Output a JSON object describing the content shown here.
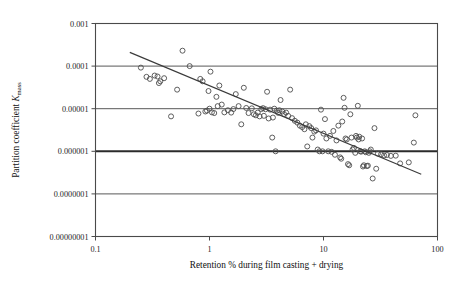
{
  "chart_data": {
    "type": "scatter",
    "title": "",
    "xlabel": "Retention % during film casting + drying",
    "ylabel_prefix": "Partition coefficient ",
    "ylabel_symbol": "K",
    "ylabel_subscript": "mass",
    "ylabel": "Partition coefficient Kmass",
    "xscale": "log",
    "yscale": "log",
    "xlim": [
      0.1,
      100
    ],
    "ylim": [
      1e-08,
      0.001
    ],
    "xticks": [
      0.1,
      1,
      10,
      100
    ],
    "xtick_labels": [
      "0.1",
      "1",
      "10",
      "100"
    ],
    "yticks": [
      0.001,
      0.0001,
      1e-05,
      1e-06,
      1e-07,
      1e-08
    ],
    "ytick_labels": [
      "0.001",
      "0.0001",
      "0.00001",
      "0.000001",
      "0.0000001",
      "0.00000001"
    ],
    "grid": "horizontal",
    "gridline_emphasis": 1e-06,
    "legend": "none",
    "marker": "open-circle",
    "marker_color": "#4d4d4d",
    "trendline": {
      "type": "power-law",
      "x_start": 0.2,
      "y_start": 0.00021,
      "x_end": 72,
      "y_end": 2.9e-07
    },
    "points": [
      {
        "x": 0.25,
        "y": 9.2e-05
      },
      {
        "x": 0.28,
        "y": 5.6e-05
      },
      {
        "x": 0.3,
        "y": 5e-05
      },
      {
        "x": 0.33,
        "y": 6e-05
      },
      {
        "x": 0.35,
        "y": 5.7e-05
      },
      {
        "x": 0.36,
        "y": 4e-05
      },
      {
        "x": 0.37,
        "y": 4.4e-05
      },
      {
        "x": 0.4,
        "y": 5.2e-05
      },
      {
        "x": 0.46,
        "y": 6.6e-06
      },
      {
        "x": 0.52,
        "y": 2.8e-05
      },
      {
        "x": 0.58,
        "y": 0.00023
      },
      {
        "x": 0.67,
        "y": 0.0001
      },
      {
        "x": 0.8,
        "y": 7.7e-06
      },
      {
        "x": 0.83,
        "y": 5e-05
      },
      {
        "x": 0.87,
        "y": 4.4e-05
      },
      {
        "x": 0.92,
        "y": 8.6e-06
      },
      {
        "x": 0.95,
        "y": 9e-06
      },
      {
        "x": 0.98,
        "y": 2.6e-05
      },
      {
        "x": 1.0,
        "y": 1e-05
      },
      {
        "x": 1.02,
        "y": 7.4e-05
      },
      {
        "x": 1.05,
        "y": 8.2e-06
      },
      {
        "x": 1.1,
        "y": 7.9e-06
      },
      {
        "x": 1.15,
        "y": 1.9e-05
      },
      {
        "x": 1.18,
        "y": 1.15e-05
      },
      {
        "x": 1.22,
        "y": 3.5e-05
      },
      {
        "x": 1.28,
        "y": 1.25e-05
      },
      {
        "x": 1.35,
        "y": 8.2e-06
      },
      {
        "x": 1.45,
        "y": 9.2e-06
      },
      {
        "x": 1.55,
        "y": 8.1e-06
      },
      {
        "x": 1.62,
        "y": 9.8e-06
      },
      {
        "x": 1.7,
        "y": 2.2e-05
      },
      {
        "x": 1.8,
        "y": 1.15e-05
      },
      {
        "x": 1.9,
        "y": 4.3e-06
      },
      {
        "x": 2.0,
        "y": 3.1e-05
      },
      {
        "x": 2.1,
        "y": 1.04e-05
      },
      {
        "x": 2.2,
        "y": 7.9e-06
      },
      {
        "x": 2.35,
        "y": 1.02e-05
      },
      {
        "x": 2.45,
        "y": 7.4e-06
      },
      {
        "x": 2.55,
        "y": 7e-06
      },
      {
        "x": 2.65,
        "y": 8.1e-06
      },
      {
        "x": 2.75,
        "y": 6.6e-06
      },
      {
        "x": 2.85,
        "y": 9.8e-06
      },
      {
        "x": 2.95,
        "y": 1.03e-05
      },
      {
        "x": 3.0,
        "y": 6.8e-06
      },
      {
        "x": 3.1,
        "y": 9.7e-06
      },
      {
        "x": 3.2,
        "y": 2.5e-05
      },
      {
        "x": 3.3,
        "y": 5.9e-06
      },
      {
        "x": 3.4,
        "y": 9.5e-06
      },
      {
        "x": 3.55,
        "y": 2.1e-06
      },
      {
        "x": 3.6,
        "y": 6.2e-06
      },
      {
        "x": 3.7,
        "y": 1e-05
      },
      {
        "x": 3.8,
        "y": 1e-06
      },
      {
        "x": 3.9,
        "y": 9e-06
      },
      {
        "x": 4.0,
        "y": 8e-06
      },
      {
        "x": 4.1,
        "y": 9.2e-06
      },
      {
        "x": 4.2,
        "y": 1.6e-05
      },
      {
        "x": 4.35,
        "y": 8.6e-06
      },
      {
        "x": 4.5,
        "y": 7.5e-06
      },
      {
        "x": 4.7,
        "y": 8.1e-06
      },
      {
        "x": 4.9,
        "y": 6.8e-06
      },
      {
        "x": 5.1,
        "y": 2.8e-05
      },
      {
        "x": 5.3,
        "y": 6e-06
      },
      {
        "x": 5.6,
        "y": 5.2e-06
      },
      {
        "x": 5.9,
        "y": 4.7e-06
      },
      {
        "x": 6.2,
        "y": 4e-06
      },
      {
        "x": 6.5,
        "y": 3.7e-06
      },
      {
        "x": 6.8,
        "y": 3.3e-06
      },
      {
        "x": 7.0,
        "y": 4.3e-06
      },
      {
        "x": 7.2,
        "y": 1.3e-06
      },
      {
        "x": 7.5,
        "y": 3.9e-06
      },
      {
        "x": 7.8,
        "y": 3.5e-06
      },
      {
        "x": 8.0,
        "y": 2.1e-06
      },
      {
        "x": 8.3,
        "y": 2.9e-06
      },
      {
        "x": 8.6,
        "y": 3.1e-06
      },
      {
        "x": 8.9,
        "y": 1.1e-06
      },
      {
        "x": 9.2,
        "y": 1e-06
      },
      {
        "x": 9.5,
        "y": 9.5e-06
      },
      {
        "x": 9.8,
        "y": 1e-06
      },
      {
        "x": 10.0,
        "y": 2.6e-06
      },
      {
        "x": 10.3,
        "y": 5.7e-06
      },
      {
        "x": 10.6,
        "y": 2e-06
      },
      {
        "x": 11.0,
        "y": 1e-06
      },
      {
        "x": 11.4,
        "y": 2.3e-06
      },
      {
        "x": 11.8,
        "y": 9.7e-07
      },
      {
        "x": 12.2,
        "y": 3e-06
      },
      {
        "x": 12.6,
        "y": 8.3e-07
      },
      {
        "x": 13.0,
        "y": 1.8e-06
      },
      {
        "x": 13.5,
        "y": 4e-06
      },
      {
        "x": 14.0,
        "y": 7.2e-07
      },
      {
        "x": 14.3,
        "y": 6.7e-07
      },
      {
        "x": 14.6,
        "y": 5e-06
      },
      {
        "x": 15.0,
        "y": 1.8e-05
      },
      {
        "x": 15.3,
        "y": 1.05e-05
      },
      {
        "x": 15.6,
        "y": 2e-06
      },
      {
        "x": 16.0,
        "y": 1.9e-06
      },
      {
        "x": 16.4,
        "y": 5e-07
      },
      {
        "x": 16.8,
        "y": 4.7e-07
      },
      {
        "x": 17.2,
        "y": 7.4e-06
      },
      {
        "x": 17.6,
        "y": 2.1e-06
      },
      {
        "x": 18.0,
        "y": 1.1e-06
      },
      {
        "x": 18.5,
        "y": 1.2e-06
      },
      {
        "x": 19.0,
        "y": 9.2e-07
      },
      {
        "x": 19.3,
        "y": 2.3e-06
      },
      {
        "x": 19.6,
        "y": 2.1e-06
      },
      {
        "x": 20.0,
        "y": 1.17e-05
      },
      {
        "x": 20.3,
        "y": 1.9e-06
      },
      {
        "x": 20.6,
        "y": 2.2e-06
      },
      {
        "x": 21.0,
        "y": 1e-06
      },
      {
        "x": 21.4,
        "y": 9.8e-07
      },
      {
        "x": 21.8,
        "y": 2e-06
      },
      {
        "x": 22.2,
        "y": 4.4e-07
      },
      {
        "x": 22.6,
        "y": 4.7e-07
      },
      {
        "x": 23.0,
        "y": 1e-06
      },
      {
        "x": 23.5,
        "y": 9.5e-07
      },
      {
        "x": 24.0,
        "y": 4.5e-07
      },
      {
        "x": 24.5,
        "y": 4.6e-07
      },
      {
        "x": 25.0,
        "y": 9.2e-07
      },
      {
        "x": 25.5,
        "y": 1e-06
      },
      {
        "x": 26.0,
        "y": 1.1e-06
      },
      {
        "x": 27.0,
        "y": 2.3e-07
      },
      {
        "x": 28.0,
        "y": 3.5e-06
      },
      {
        "x": 29.0,
        "y": 3.9e-07
      },
      {
        "x": 30.0,
        "y": 8.8e-07
      },
      {
        "x": 32.0,
        "y": 8.5e-07
      },
      {
        "x": 34.0,
        "y": 8e-07
      },
      {
        "x": 36.0,
        "y": 8.2e-07
      },
      {
        "x": 39.0,
        "y": 7.8e-07
      },
      {
        "x": 43.0,
        "y": 7.9e-07
      },
      {
        "x": 47.0,
        "y": 5.2e-07
      },
      {
        "x": 56.0,
        "y": 5.5e-07
      },
      {
        "x": 62.0,
        "y": 1.6e-06
      },
      {
        "x": 64.0,
        "y": 7e-06
      }
    ]
  }
}
